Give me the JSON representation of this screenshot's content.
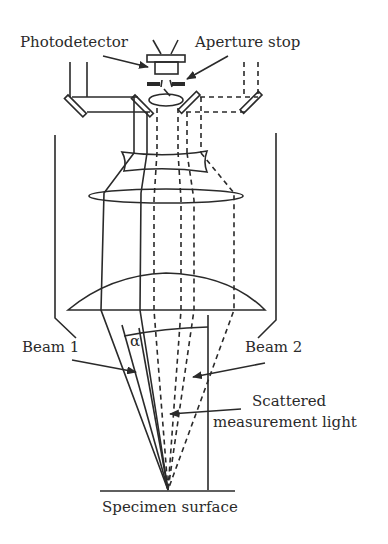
{
  "diagram": {
    "type": "optical-schematic",
    "labels": {
      "photodetector": "Photodetector",
      "aperture_stop": "Aperture stop",
      "beam1": "Beam 1",
      "beam2": "Beam 2",
      "scattered_line1": "Scattered",
      "scattered_line2": "measurement light",
      "specimen": "Specimen surface",
      "angle": "α"
    },
    "colors": {
      "ink": "#2a2a2a",
      "background": "#ffffff"
    }
  }
}
